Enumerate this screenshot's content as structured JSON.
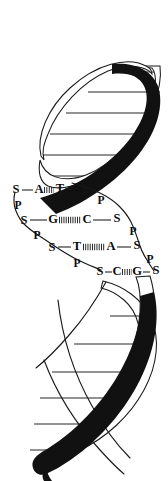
{
  "figure": {
    "colors": {
      "strand_filled": "#111111",
      "strand_outline": "#ffffff",
      "ink": "#1a1a1a",
      "background": "#ffffff"
    }
  },
  "base_pairs": [
    {
      "left_sugar": "S",
      "left_base": "A",
      "bond": "hb2",
      "right_base": "T",
      "right_sugar": "S"
    },
    {
      "left_sugar": "S",
      "left_base": "G",
      "bond": "hb3",
      "right_base": "C",
      "right_sugar": "S"
    },
    {
      "left_sugar": "S",
      "left_base": "T",
      "bond": "hb3",
      "right_base": "A",
      "right_sugar": "S"
    },
    {
      "left_sugar": "S",
      "left_base": "C",
      "bond": "hb2",
      "right_base": "G",
      "right_sugar": "S"
    }
  ],
  "backbone_left": [
    "S",
    "P",
    "S",
    "P",
    "S",
    "P",
    "S"
  ],
  "backbone_right": [
    "S",
    "P",
    "S",
    "P",
    "S",
    "P",
    "S"
  ],
  "labels": {
    "sugar": "S",
    "phosphate": "P",
    "adenine": "A",
    "thymine": "T",
    "guanine": "G",
    "cytosine": "C"
  }
}
